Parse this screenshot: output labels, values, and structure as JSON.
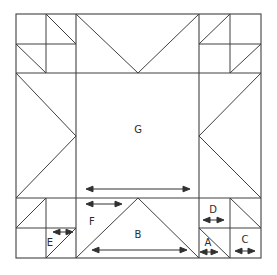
{
  "diagram": {
    "type": "quilt-block-piecing-diagram",
    "stroke_color": "#404040",
    "background_color": "#ffffff",
    "label_color": "#2b2b2b",
    "frame": {
      "x": 16,
      "y": 14,
      "width": 245,
      "height": 244
    },
    "grid": {
      "columns_x": [
        16,
        76,
        199,
        261
      ],
      "rows_y": [
        14,
        73,
        198,
        258
      ],
      "corner_mid_x_left": 46,
      "corner_mid_x_right": 230,
      "corner_mid_y_top": 44,
      "corner_mid_y_bottom": 228,
      "center_x": 138,
      "center_y": 136
    },
    "labels": [
      {
        "id": "G",
        "text": "G",
        "x": 138,
        "y": 130,
        "role": "center-square"
      },
      {
        "id": "B",
        "text": "B",
        "x": 138,
        "y": 235,
        "role": "star-point-triangle"
      },
      {
        "id": "F",
        "text": "F",
        "x": 92,
        "y": 222,
        "role": "half-star-point"
      },
      {
        "id": "D",
        "text": "D",
        "x": 213,
        "y": 210,
        "role": "corner-small-square"
      },
      {
        "id": "A",
        "text": "A",
        "x": 208,
        "y": 243,
        "role": "corner-triangle"
      },
      {
        "id": "C",
        "text": "C",
        "x": 245,
        "y": 240,
        "role": "corner-square"
      },
      {
        "id": "E",
        "text": "E",
        "x": 50,
        "y": 243,
        "role": "corner-triangle"
      }
    ],
    "measure_arrows": [
      {
        "id": "G-width",
        "label": "G",
        "x1": 88,
        "x2": 188,
        "y": 189,
        "double_headed": true
      },
      {
        "id": "F-width",
        "label": "F",
        "x1": 88,
        "x2": 120,
        "y": 204,
        "double_headed": true
      },
      {
        "id": "B-width",
        "label": "B",
        "x1": 94,
        "x2": 185,
        "y": 250,
        "double_headed": true
      },
      {
        "id": "D-width",
        "label": "D",
        "x1": 205,
        "x2": 222,
        "y": 220,
        "double_headed": true
      },
      {
        "id": "A-width",
        "label": "A",
        "x1": 202,
        "x2": 216,
        "y": 252,
        "double_headed": true
      },
      {
        "id": "C-width",
        "label": "C",
        "x1": 237,
        "x2": 253,
        "y": 251,
        "double_headed": true
      },
      {
        "id": "E-width",
        "label": "E",
        "x1": 55,
        "x2": 71,
        "y": 232,
        "double_headed": true
      }
    ],
    "piece_legend": [
      {
        "key": "A",
        "description": "small corner half-square triangle"
      },
      {
        "key": "B",
        "description": "large star point triangle"
      },
      {
        "key": "C",
        "description": "corner square"
      },
      {
        "key": "D",
        "description": "small square"
      },
      {
        "key": "E",
        "description": "small corner half-square triangle"
      },
      {
        "key": "F",
        "description": "half of star point width"
      },
      {
        "key": "G",
        "description": "center square"
      }
    ]
  }
}
